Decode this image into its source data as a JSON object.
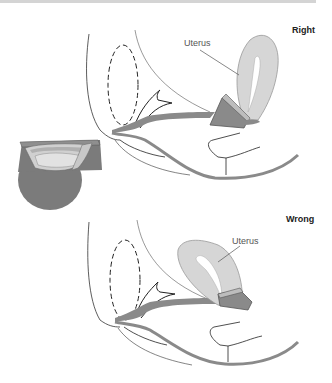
{
  "panels": [
    {
      "label": "Right",
      "uterus_label": "Uterus"
    },
    {
      "label": "Wrong",
      "uterus_label": "Uterus"
    }
  ],
  "colors": {
    "tissue_dark": "#8a8a8a",
    "uterus_fill": "#d6d6d6",
    "cup_dark": "#7b7b7b",
    "cup_light": "#cfcfcf",
    "line": "#222222"
  }
}
